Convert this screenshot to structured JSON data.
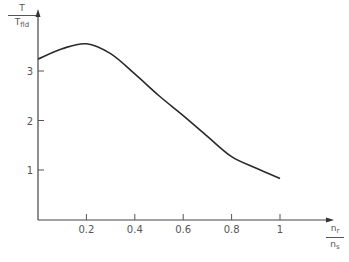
{
  "chart_data": {
    "type": "line",
    "title": "",
    "xlabel": "n_r / n_s",
    "ylabel": "T / T_fld",
    "xlabel_num": "n",
    "xlabel_num_sub": "r",
    "xlabel_den": "n",
    "xlabel_den_sub": "s",
    "ylabel_num": "T",
    "ylabel_den": "T",
    "ylabel_den_sub": "fld",
    "x_ticks": [
      "0.2",
      "0.4",
      "0.6",
      "0.8",
      "1"
    ],
    "y_ticks": [
      "1",
      "2",
      "3"
    ],
    "xlim": [
      0,
      1.1
    ],
    "ylim": [
      0,
      3.9
    ],
    "grid": false,
    "legend": null,
    "series": [
      {
        "name": "T/T_fld",
        "x": [
          0,
          0.1,
          0.2,
          0.3,
          0.4,
          0.5,
          0.6,
          0.7,
          0.8,
          0.9,
          1.0
        ],
        "y": [
          3.24,
          3.45,
          3.55,
          3.35,
          2.94,
          2.5,
          2.1,
          1.68,
          1.27,
          1.04,
          0.83
        ]
      }
    ]
  }
}
